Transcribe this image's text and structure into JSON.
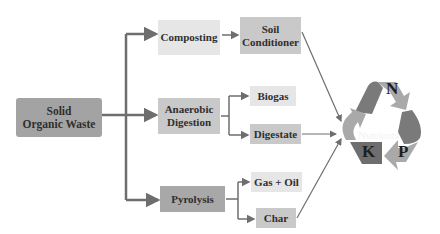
{
  "diagram": {
    "source": {
      "label_line1": "Solid",
      "label_line2": "Organic Waste"
    },
    "processes": [
      {
        "id": "composting",
        "label": "Composting"
      },
      {
        "id": "anaerobic",
        "label_line1": "Anaerobic",
        "label_line2": "Digestion"
      },
      {
        "id": "pyrolysis",
        "label": "Pyrolysis"
      }
    ],
    "products": {
      "soil_conditioner": {
        "label_line1": "Soil",
        "label_line2": "Conditioner"
      },
      "biogas": {
        "label": "Biogas"
      },
      "digestate": {
        "label": "Digestate"
      },
      "gas_oil": {
        "label": "Gas + Oil"
      },
      "char": {
        "label": "Char"
      }
    },
    "nutrients": {
      "label": "Nutrients",
      "letters": [
        "N",
        "P",
        "K"
      ]
    },
    "edges": [
      [
        "Solid Organic Waste",
        "Composting"
      ],
      [
        "Solid Organic Waste",
        "Anaerobic Digestion"
      ],
      [
        "Solid Organic Waste",
        "Pyrolysis"
      ],
      [
        "Composting",
        "Soil Conditioner"
      ],
      [
        "Anaerobic Digestion",
        "Biogas"
      ],
      [
        "Anaerobic Digestion",
        "Digestate"
      ],
      [
        "Pyrolysis",
        "Gas + Oil"
      ],
      [
        "Pyrolysis",
        "Char"
      ],
      [
        "Soil Conditioner",
        "Nutrients"
      ],
      [
        "Digestate",
        "Nutrients"
      ],
      [
        "Char",
        "Nutrients"
      ]
    ],
    "colors": {
      "arrow": "#6e6e6e",
      "box_dark": "#a8a8a8",
      "box_mid": "#c9c9c9",
      "box_light": "#e6e6e6",
      "recycle_dark": "#7a7a7a",
      "recycle_light": "#a9a9a9"
    }
  }
}
